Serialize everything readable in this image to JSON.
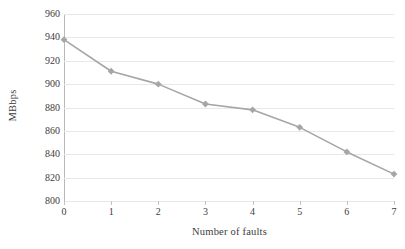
{
  "chart_data": {
    "type": "line",
    "title": "",
    "xlabel": "Number of faults",
    "ylabel": "MBbps",
    "x": [
      0,
      1,
      2,
      3,
      4,
      5,
      6,
      7
    ],
    "categories": [
      "0",
      "1",
      "2",
      "3",
      "4",
      "5",
      "6",
      "7"
    ],
    "values": [
      938,
      911,
      900,
      883,
      878,
      863,
      842,
      823
    ],
    "series": [
      {
        "name": "MBbps",
        "values": [
          938,
          911,
          900,
          883,
          878,
          863,
          842,
          823
        ]
      }
    ],
    "ylim": [
      800,
      960
    ],
    "xlim": [
      0,
      7
    ],
    "yticks": [
      800,
      820,
      840,
      860,
      880,
      900,
      920,
      940,
      960
    ],
    "ytick_labels": [
      "800",
      "820",
      "840",
      "860",
      "880",
      "900",
      "920",
      "940",
      "960"
    ],
    "xticks": [
      0,
      1,
      2,
      3,
      4,
      5,
      6,
      7
    ],
    "xtick_labels": [
      "0",
      "1",
      "2",
      "3",
      "4",
      "5",
      "6",
      "7"
    ],
    "grid": "horizontal",
    "legend": "none",
    "line_color": "#a6a6a6",
    "marker_color": "#a6a6a6",
    "marker_shape": "diamond",
    "grid_color": "#e8e8e8",
    "axis_color": "#b9b9b9",
    "text_color": "#3c3c3c",
    "background": "#ffffff"
  }
}
